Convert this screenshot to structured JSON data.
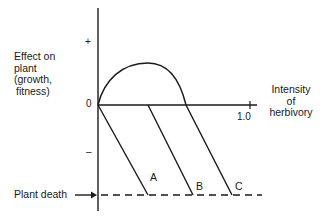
{
  "diagram": {
    "y_axis": {
      "label_lines": [
        "Effect on",
        "plant",
        "(growth,",
        "fitness)"
      ],
      "positive_mark": "+",
      "negative_mark": "–",
      "origin_label": "0"
    },
    "x_axis": {
      "label_lines": [
        "Intensity",
        "of",
        "herbivory"
      ],
      "end_tick_label": "1.0"
    },
    "baseline": {
      "label": "Plant death",
      "style": "dashed"
    },
    "curves": [
      {
        "id": "A",
        "label": "A",
        "description": "straight decline from origin to plant death"
      },
      {
        "id": "B",
        "label": "B",
        "description": "no effect at low intensity, then decline to plant death"
      },
      {
        "id": "C",
        "label": "C",
        "description": "overcompensation (positive hump), then decline to plant death"
      }
    ],
    "colors": {
      "ink": "#1a1a1a",
      "background": "#ffffff"
    }
  }
}
